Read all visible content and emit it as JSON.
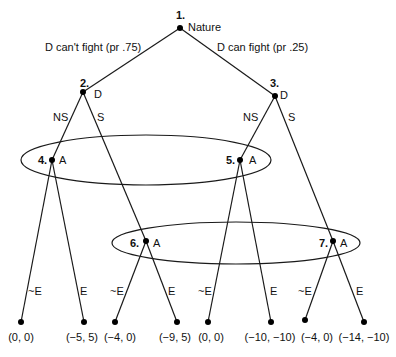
{
  "diagram": {
    "type": "extensive-form game tree",
    "nodes": [
      {
        "id": "1",
        "num_label": "1.",
        "player": "Nature",
        "x": 180,
        "y": 28
      },
      {
        "id": "2",
        "num_label": "2.",
        "player": "D",
        "x": 83,
        "y": 92
      },
      {
        "id": "3",
        "num_label": "3.",
        "player": "D",
        "x": 275,
        "y": 96
      },
      {
        "id": "4",
        "num_label": "4.",
        "player": "A",
        "x": 52,
        "y": 160
      },
      {
        "id": "5",
        "num_label": "5.",
        "player": "A",
        "x": 240,
        "y": 160
      },
      {
        "id": "6",
        "num_label": "6.",
        "player": "A",
        "x": 146,
        "y": 241
      },
      {
        "id": "7",
        "num_label": "7.",
        "player": "A",
        "x": 333,
        "y": 241
      }
    ],
    "moves": {
      "nature_left": "D can't fight (pr .75)",
      "nature_right": "D can fight (pr .25)",
      "d2_left": "NS",
      "d2_right": "S",
      "d3_left": "NS",
      "d3_right": "S",
      "a4_left": "~E",
      "a4_right": "E",
      "a6_left": "~E",
      "a6_right": "E",
      "a5_left": "~E",
      "a5_right": "E",
      "a7_left": "~E",
      "a7_right": "E"
    },
    "payoffs": [
      "(0, 0)",
      "(−5, 5)",
      "(−4, 0)",
      "(−9, 5)",
      "(0, 0)",
      "(−10, −10)",
      "(−4, 0)",
      "(−14, −10)"
    ],
    "information_sets": [
      {
        "nodes": [
          "4",
          "5"
        ],
        "player": "A"
      },
      {
        "nodes": [
          "6",
          "7"
        ],
        "player": "A"
      }
    ]
  }
}
